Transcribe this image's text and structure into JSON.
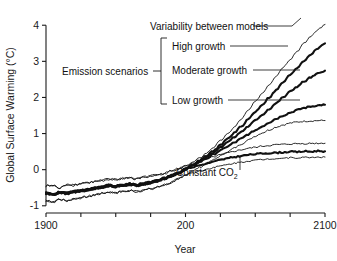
{
  "chart_data": {
    "type": "line",
    "title": "",
    "xlabel": "Year",
    "ylabel": "Global Surface Warming (°C)",
    "xlim": [
      1900,
      2100
    ],
    "ylim": [
      -1.2,
      4.2
    ],
    "grid": false,
    "legend_position": "inline-annotations",
    "xticks": [
      1900,
      1925,
      1950,
      1975,
      2000,
      2025,
      2050,
      2075,
      2100
    ],
    "xtick_labels": [
      "1900",
      "",
      "",
      "",
      "200",
      "",
      "",
      "",
      "2100"
    ],
    "yticks": [
      -1,
      0,
      1,
      2,
      3,
      4
    ],
    "ytick_labels": [
      "-1",
      "0",
      "1",
      "2",
      "3",
      "4"
    ],
    "x": [
      1900,
      1905,
      1910,
      1915,
      1920,
      1925,
      1930,
      1935,
      1940,
      1945,
      1950,
      1955,
      1960,
      1965,
      1970,
      1975,
      1980,
      1985,
      1990,
      1995,
      2000,
      2005,
      2010,
      2015,
      2020,
      2025,
      2030,
      2035,
      2040,
      2045,
      2050,
      2055,
      2060,
      2065,
      2070,
      2075,
      2080,
      2085,
      2090,
      2095,
      2100
    ],
    "series": [
      {
        "name": "High growth upper bound",
        "style": "thin",
        "values": [
          -0.45,
          -0.44,
          -0.52,
          -0.41,
          -0.43,
          -0.38,
          -0.36,
          -0.33,
          -0.3,
          -0.26,
          -0.28,
          -0.24,
          -0.22,
          -0.26,
          -0.21,
          -0.18,
          -0.14,
          -0.1,
          -0.04,
          0.03,
          0.1,
          0.2,
          0.32,
          0.46,
          0.62,
          0.8,
          0.98,
          1.18,
          1.4,
          1.64,
          1.88,
          2.12,
          2.36,
          2.6,
          2.84,
          3.06,
          3.28,
          3.5,
          3.7,
          3.88,
          4.02
        ]
      },
      {
        "name": "High growth",
        "style": "thick",
        "values": [
          -0.65,
          -0.68,
          -0.63,
          -0.66,
          -0.61,
          -0.59,
          -0.56,
          -0.52,
          -0.48,
          -0.44,
          -0.46,
          -0.43,
          -0.4,
          -0.43,
          -0.39,
          -0.35,
          -0.3,
          -0.24,
          -0.17,
          -0.09,
          0.02,
          0.13,
          0.25,
          0.38,
          0.52,
          0.68,
          0.85,
          1.02,
          1.2,
          1.4,
          1.6,
          1.8,
          2.0,
          2.2,
          2.42,
          2.62,
          2.82,
          3.02,
          3.2,
          3.36,
          3.5
        ]
      },
      {
        "name": "Moderate growth",
        "style": "thick",
        "values": [
          -0.65,
          -0.68,
          -0.63,
          -0.66,
          -0.61,
          -0.59,
          -0.56,
          -0.52,
          -0.48,
          -0.44,
          -0.46,
          -0.43,
          -0.4,
          -0.43,
          -0.39,
          -0.35,
          -0.3,
          -0.24,
          -0.17,
          -0.09,
          0.02,
          0.12,
          0.23,
          0.35,
          0.48,
          0.62,
          0.76,
          0.9,
          1.05,
          1.2,
          1.36,
          1.52,
          1.68,
          1.84,
          2.0,
          2.16,
          2.3,
          2.44,
          2.56,
          2.66,
          2.74
        ]
      },
      {
        "name": "Low growth",
        "style": "thick",
        "values": [
          -0.65,
          -0.68,
          -0.63,
          -0.66,
          -0.61,
          -0.59,
          -0.56,
          -0.52,
          -0.48,
          -0.44,
          -0.46,
          -0.43,
          -0.4,
          -0.43,
          -0.39,
          -0.35,
          -0.3,
          -0.24,
          -0.17,
          -0.09,
          0.02,
          0.11,
          0.21,
          0.31,
          0.42,
          0.53,
          0.64,
          0.75,
          0.86,
          0.98,
          1.09,
          1.2,
          1.31,
          1.41,
          1.5,
          1.58,
          1.65,
          1.71,
          1.75,
          1.78,
          1.8
        ]
      },
      {
        "name": "Low growth lower bound",
        "style": "thin",
        "values": [
          -0.85,
          -0.9,
          -0.82,
          -0.86,
          -0.8,
          -0.78,
          -0.74,
          -0.7,
          -0.66,
          -0.62,
          -0.64,
          -0.61,
          -0.58,
          -0.61,
          -0.57,
          -0.53,
          -0.48,
          -0.42,
          -0.35,
          -0.26,
          -0.14,
          -0.04,
          0.06,
          0.16,
          0.27,
          0.38,
          0.49,
          0.6,
          0.71,
          0.82,
          0.93,
          1.02,
          1.1,
          1.18,
          1.24,
          1.29,
          1.32,
          1.34,
          1.35,
          1.36,
          1.36
        ]
      },
      {
        "name": "Constant CO2 upper bound",
        "style": "thin",
        "values": [
          -0.45,
          -0.44,
          -0.52,
          -0.41,
          -0.43,
          -0.38,
          -0.36,
          -0.33,
          -0.3,
          -0.26,
          -0.28,
          -0.24,
          -0.22,
          -0.26,
          -0.21,
          -0.18,
          -0.14,
          -0.1,
          -0.04,
          0.03,
          0.1,
          0.17,
          0.23,
          0.29,
          0.35,
          0.41,
          0.46,
          0.51,
          0.55,
          0.59,
          0.62,
          0.65,
          0.67,
          0.69,
          0.7,
          0.71,
          0.72,
          0.72,
          0.73,
          0.73,
          0.73
        ]
      },
      {
        "name": "Constant CO2",
        "style": "thick",
        "values": [
          -0.65,
          -0.68,
          -0.63,
          -0.66,
          -0.61,
          -0.59,
          -0.56,
          -0.52,
          -0.48,
          -0.44,
          -0.46,
          -0.43,
          -0.4,
          -0.43,
          -0.39,
          -0.35,
          -0.3,
          -0.24,
          -0.17,
          -0.09,
          0.02,
          0.07,
          0.12,
          0.17,
          0.22,
          0.27,
          0.31,
          0.35,
          0.38,
          0.41,
          0.43,
          0.45,
          0.46,
          0.47,
          0.48,
          0.5,
          0.49,
          0.51,
          0.5,
          0.52,
          0.51
        ]
      },
      {
        "name": "Constant CO2 lower bound",
        "style": "thin",
        "values": [
          -0.85,
          -0.9,
          -0.82,
          -0.86,
          -0.8,
          -0.78,
          -0.74,
          -0.7,
          -0.66,
          -0.62,
          -0.64,
          -0.61,
          -0.58,
          -0.61,
          -0.57,
          -0.53,
          -0.48,
          -0.42,
          -0.35,
          -0.26,
          -0.14,
          -0.09,
          -0.04,
          0.01,
          0.06,
          0.1,
          0.14,
          0.18,
          0.21,
          0.24,
          0.26,
          0.28,
          0.3,
          0.31,
          0.32,
          0.33,
          0.33,
          0.34,
          0.34,
          0.35,
          0.35
        ]
      }
    ],
    "annotations": [
      {
        "id": "variability",
        "text": "Variability between models"
      },
      {
        "id": "high_growth",
        "text": "High growth"
      },
      {
        "id": "moderate_growth",
        "text": "Moderate growth"
      },
      {
        "id": "low_growth",
        "text": "Low growth"
      },
      {
        "id": "emission_scenarios",
        "text": "Emission scenarios"
      },
      {
        "id": "constant_co2",
        "text": "Constant CO"
      },
      {
        "id": "constant_co2_sub",
        "text": "2"
      }
    ]
  },
  "colors": {
    "line": "#111111",
    "axis": "#1a1a1a",
    "background": "#ffffff"
  }
}
